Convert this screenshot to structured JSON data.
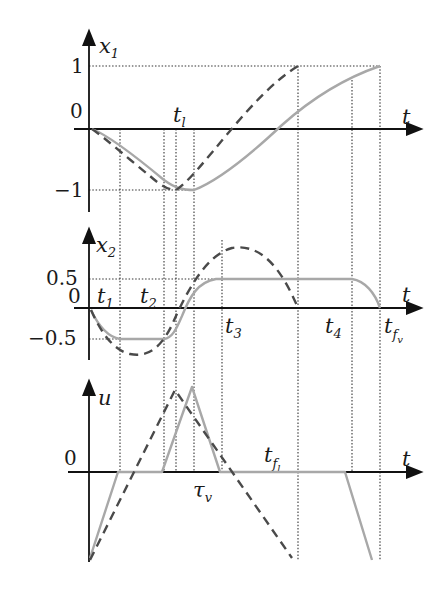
{
  "diagram": {
    "panels": [
      {
        "id": "x1",
        "ylabel": "x",
        "ylabel_sub": "1",
        "xlabel": "t",
        "ticks": {
          "top": "1",
          "zero": "0",
          "bottom": "−1"
        },
        "time_labels": [
          {
            "text": "t",
            "sub": "l"
          }
        ]
      },
      {
        "id": "x2",
        "ylabel": "x",
        "ylabel_sub": "2",
        "xlabel": "t",
        "ticks": {
          "top": "0.5",
          "zero": "0",
          "bottom": "−0.5"
        },
        "time_labels": [
          {
            "text": "t",
            "sub": "1"
          },
          {
            "text": "t",
            "sub": "2"
          },
          {
            "text": "t",
            "sub": "3"
          },
          {
            "text": "t",
            "sub": "4"
          },
          {
            "text": "t",
            "sub": "f",
            "subsub": "v"
          }
        ]
      },
      {
        "id": "u",
        "ylabel": "u",
        "xlabel": "t",
        "ticks": {
          "zero": "0"
        },
        "time_labels": [
          {
            "text": "τ",
            "sub": "v"
          },
          {
            "text": "t",
            "sub": "f",
            "subsub": "l"
          }
        ]
      }
    ],
    "legend_styles": {
      "solid_color": "#a8a8a8",
      "dashed_color": "#4a4a4a"
    }
  }
}
